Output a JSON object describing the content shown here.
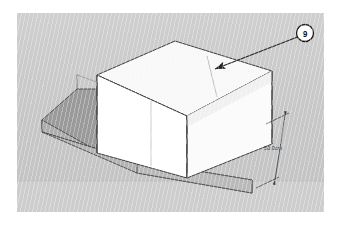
{
  "viewport": {
    "background_color": "#c9c9c9",
    "ground_color": "#cdcdcd",
    "page_margin_color": "#ffffff"
  },
  "model": {
    "name": "slab-with-box",
    "base_slab": {
      "label": "base-slab",
      "top_face_color": "#9a9a9a",
      "front_face_color": "#b5b5b5",
      "side_face_color": "#a9a9a9",
      "edge_color": "#4a4a4a"
    },
    "box": {
      "label": "extruded-box",
      "top_face_color": "#f7f7f7",
      "front_face_color": "#ffffff",
      "right_face_color": "#ededed",
      "edge_color": "#3d3d3d",
      "divider_edge_color": "#a8a8a8"
    }
  },
  "dimension": {
    "name": "height-dimension",
    "value": "50.0cm",
    "color": "#3a3a3a"
  },
  "callout": {
    "name": "annotation-callout",
    "number": "9",
    "circle_fill": "#ffffff",
    "circle_stroke": "#1a1a1a",
    "leader_color": "#2a2a2a"
  }
}
